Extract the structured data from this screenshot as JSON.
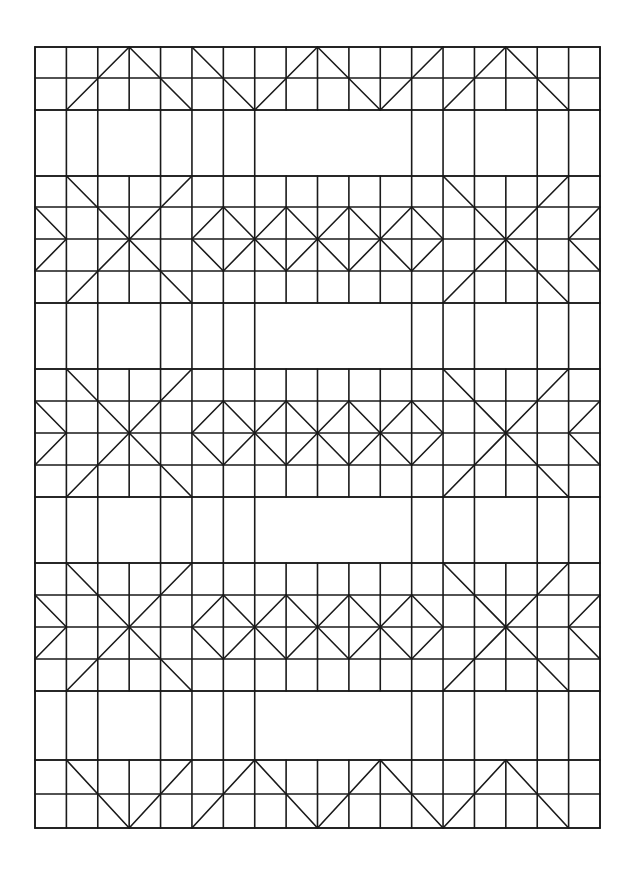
{
  "title": "Quilt pattern line drawing",
  "colors": {
    "line": "#1a1a1a",
    "background": "#ffffff"
  },
  "grid": {
    "x0": 35,
    "x1": 600,
    "cols": 18,
    "rows_y": {
      "border_top": [
        47,
        78,
        110
      ],
      "sash1": [
        110,
        176
      ],
      "block1": [
        176,
        207,
        239,
        271,
        303
      ],
      "sash2": [
        303,
        369
      ],
      "block2": [
        369,
        401,
        433,
        465,
        497
      ],
      "sash3": [
        497,
        563
      ],
      "block3": [
        563,
        595,
        627,
        659,
        691
      ],
      "sash4": [
        691,
        760
      ],
      "border_bottom": [
        760,
        794,
        828
      ]
    }
  },
  "pattern": {
    "border_top_zigzag": [
      [
        1,
        "b"
      ],
      [
        3,
        "t"
      ],
      [
        5,
        "b"
      ]
    ],
    "border_top_zigzag2": [
      [
        5,
        "t"
      ],
      [
        7,
        "b"
      ],
      [
        9,
        "t"
      ],
      [
        11,
        "b"
      ],
      [
        13,
        "t"
      ]
    ],
    "border_top_zigzag3": [
      [
        13,
        "b"
      ],
      [
        15,
        "t"
      ],
      [
        17,
        "b"
      ]
    ],
    "border_bottom_zigzag": [
      [
        1,
        "t"
      ],
      [
        3,
        "b"
      ],
      [
        5,
        "t"
      ]
    ],
    "border_bottom_zigzag2": [
      [
        5,
        "b"
      ],
      [
        7,
        "t"
      ],
      [
        9,
        "b"
      ],
      [
        11,
        "t"
      ],
      [
        13,
        "b"
      ],
      [
        15,
        "t"
      ],
      [
        17,
        "b"
      ]
    ],
    "sash_verticals": [
      0,
      1,
      2,
      4,
      5,
      6,
      7,
      12,
      13,
      14,
      16,
      17,
      18
    ],
    "x_blocks": [
      {
        "from": 1,
        "to": 5
      },
      {
        "from": 13,
        "to": 17
      }
    ],
    "diamonds": {
      "from": 5,
      "count": 4,
      "width": 2
    },
    "half_diamonds": [
      {
        "edge": 0,
        "tip": 1
      },
      {
        "edge": 18,
        "tip": 17
      }
    ],
    "block_rows": [
      "block1",
      "block2",
      "block3"
    ],
    "sash_rows": [
      "sash1",
      "sash2",
      "sash3",
      "sash4"
    ]
  }
}
